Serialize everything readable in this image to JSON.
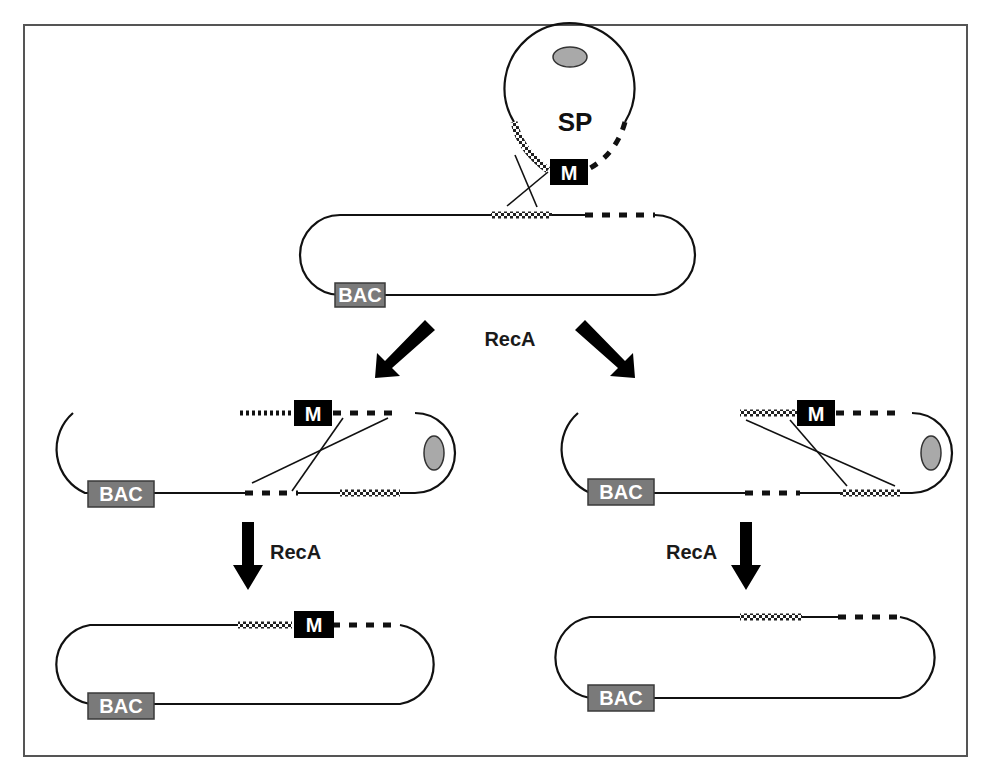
{
  "figure": {
    "type": "BAC recombineering / shuttle plasmid allelic exchange schematic",
    "labels": {
      "shuttle_plasmid": "SP",
      "marker": "M",
      "bac": "BAC",
      "enzyme": "RecA"
    },
    "stages": [
      {
        "id": "top-sp",
        "description": "Shuttle plasmid (SP) with origin, checkered homology arm, marker M, hatched homology arm"
      },
      {
        "id": "top-bac",
        "description": "Target BAC with checkered and hatched homology regions, BAC vector"
      },
      {
        "id": "mid-left",
        "description": "Cointegrate via checkered-arm crossover; second crossover via hatched arm"
      },
      {
        "id": "mid-right",
        "description": "Cointegrate; second crossover via checkered arm"
      },
      {
        "id": "bottom-left",
        "description": "Resolved BAC carrying marker M between checkered and hatched regions"
      },
      {
        "id": "bottom-right",
        "description": "Resolved BAC reverted to original (no marker)"
      }
    ],
    "arrows": [
      {
        "from": "top",
        "to": "mid-left",
        "label": "RecA"
      },
      {
        "from": "top",
        "to": "mid-right",
        "label": ""
      },
      {
        "from": "mid-left",
        "to": "bottom-left",
        "label": "RecA"
      },
      {
        "from": "mid-right",
        "to": "bottom-right",
        "label": "RecA"
      }
    ],
    "colors": {
      "line": "#111111",
      "bac_box": "#7a7a7a",
      "marker_box": "#000000",
      "origin": "#a9a9a9",
      "frame": "#555555"
    }
  }
}
